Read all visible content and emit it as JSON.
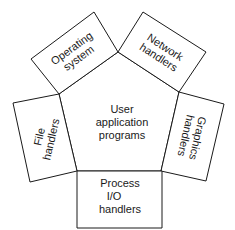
{
  "diagram": {
    "center": {
      "lines": [
        "User",
        "application",
        "programs"
      ]
    },
    "boxes": [
      {
        "id": "operating-system",
        "lines": [
          "Operating",
          "system"
        ]
      },
      {
        "id": "network-handlers",
        "lines": [
          "Network",
          "handlers"
        ]
      },
      {
        "id": "graphics-handlers",
        "lines": [
          "Graphics",
          "handlers"
        ]
      },
      {
        "id": "process-io-handlers",
        "lines": [
          "Process",
          "I/O",
          "handlers"
        ]
      },
      {
        "id": "file-handlers",
        "lines": [
          "File",
          "handlers"
        ]
      }
    ],
    "colors": {
      "stroke": "#1a1a1a",
      "background": "#ffffff"
    }
  }
}
